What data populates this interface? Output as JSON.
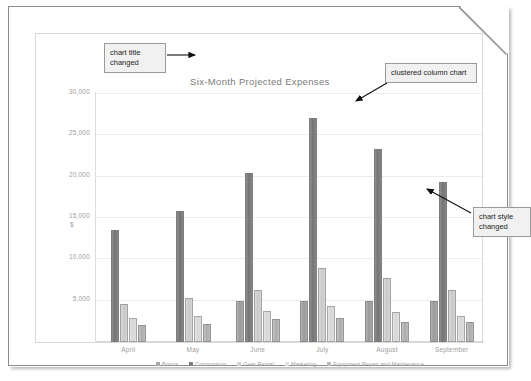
{
  "document": {
    "page_style": "folded-corner-sheet"
  },
  "chart": {
    "title": "Six-Month Projected Expenses",
    "currency_symbol": "$"
  },
  "annotations": [
    {
      "id": "chart-title-changed",
      "text": "chart title changed"
    },
    {
      "id": "clustered-column-chart",
      "text": "clustered column chart"
    },
    {
      "id": "chart-style-changed",
      "text": "chart style changed"
    }
  ],
  "chart_data": {
    "type": "bar",
    "title": "Six-Month Projected Expenses",
    "xlabel": "",
    "ylabel": "",
    "ylim": [
      0,
      30000
    ],
    "grid": true,
    "legend_position": "bottom",
    "ytick_labels": [
      "30,000",
      "25,000",
      "20,000",
      "15,000",
      "10,000",
      "5,000"
    ],
    "yticks": [
      30000,
      25000,
      20000,
      15000,
      10000,
      5000
    ],
    "categories": [
      "April",
      "May",
      "June",
      "July",
      "August",
      "September"
    ],
    "series": [
      {
        "name": "Bonus",
        "color": "#a8a8a8",
        "values": [
          0,
          0,
          5000,
          5000,
          5000,
          5000
        ]
      },
      {
        "name": "Commission",
        "color": "#7d7d7d",
        "values": [
          13500,
          15800,
          20400,
          27100,
          23300,
          19400
        ]
      },
      {
        "name": "Gear Rental",
        "color": "#d2d2d2",
        "values": [
          4600,
          5300,
          6300,
          9000,
          7700,
          6300
        ]
      },
      {
        "name": "Marketing",
        "color": "#e0e0e0",
        "values": [
          2900,
          3100,
          3700,
          4300,
          3600,
          3100
        ]
      },
      {
        "name": "Equipment Repair and Maintenance",
        "color": "#bababa",
        "values": [
          2100,
          2200,
          2800,
          2900,
          2400,
          2400
        ]
      }
    ]
  }
}
